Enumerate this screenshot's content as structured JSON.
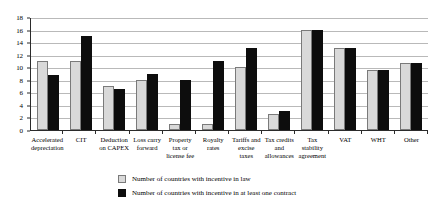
{
  "chart_data": {
    "type": "bar",
    "title": "",
    "xlabel": "",
    "ylabel": "",
    "ylim": [
      0,
      18
    ],
    "ytick_step": 2,
    "yticks": [
      "18",
      "16",
      "14",
      "12",
      "10",
      "8",
      "6",
      "4",
      "2",
      "0"
    ],
    "grid": true,
    "legend_position": "bottom",
    "categories": [
      "Accelerated depreciation",
      "CIT",
      "Deduction on CAPEX",
      "Loss carry forward",
      "Property tax or license fee",
      "Royalty rates",
      "Tariffs and excise taxes",
      "Tax credits and allowances",
      "Tax stability agreement",
      "VAT",
      "WHT",
      "Other"
    ],
    "series": [
      {
        "name": "Number of countries with incentive in law",
        "color": "#d9d9d9",
        "values": [
          11,
          11,
          7,
          8,
          1,
          1,
          10,
          2.5,
          16,
          13,
          9.5,
          10.7
        ]
      },
      {
        "name": "Number of countries with incentive in at least one contract",
        "color": "#0d0d0d",
        "values": [
          8.7,
          14.9,
          6.5,
          9,
          8,
          11,
          13,
          3,
          16,
          13,
          9.5,
          10.7
        ]
      }
    ]
  }
}
